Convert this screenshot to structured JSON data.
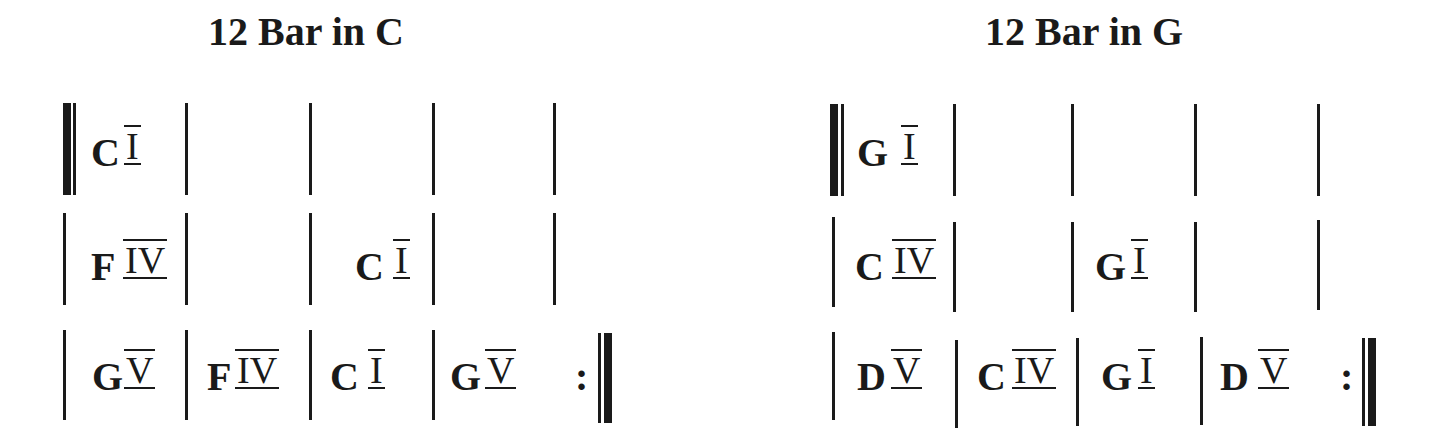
{
  "charts": [
    {
      "title": "12 Bar in C",
      "rows": [
        [
          {
            "chord": "C",
            "numeral": "I"
          },
          {
            "chord": "",
            "numeral": ""
          },
          {
            "chord": "",
            "numeral": ""
          },
          {
            "chord": "",
            "numeral": ""
          }
        ],
        [
          {
            "chord": "F",
            "numeral": "IV"
          },
          {
            "chord": "",
            "numeral": ""
          },
          {
            "chord": "C",
            "numeral": "I"
          },
          {
            "chord": "",
            "numeral": ""
          }
        ],
        [
          {
            "chord": "G",
            "numeral": "V"
          },
          {
            "chord": "F",
            "numeral": "IV"
          },
          {
            "chord": "C",
            "numeral": "I"
          },
          {
            "chord": "G",
            "numeral": "V"
          }
        ]
      ],
      "repeat_sign": ":"
    },
    {
      "title": "12 Bar in G",
      "rows": [
        [
          {
            "chord": "G",
            "numeral": "I"
          },
          {
            "chord": "",
            "numeral": ""
          },
          {
            "chord": "",
            "numeral": ""
          },
          {
            "chord": "",
            "numeral": ""
          }
        ],
        [
          {
            "chord": "C",
            "numeral": "IV"
          },
          {
            "chord": "",
            "numeral": ""
          },
          {
            "chord": "G",
            "numeral": "I"
          },
          {
            "chord": "",
            "numeral": ""
          }
        ],
        [
          {
            "chord": "D",
            "numeral": "V"
          },
          {
            "chord": "C",
            "numeral": "IV"
          },
          {
            "chord": "G",
            "numeral": "I"
          },
          {
            "chord": "D",
            "numeral": "V"
          }
        ]
      ],
      "repeat_sign": ":"
    }
  ]
}
